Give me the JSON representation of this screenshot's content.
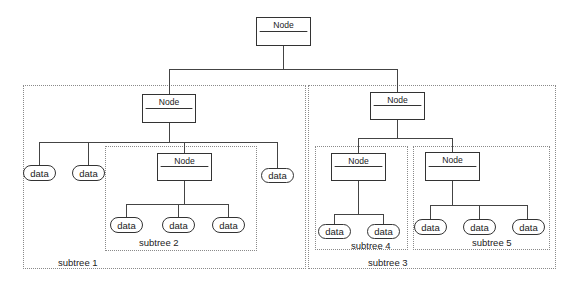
{
  "diagram": {
    "type": "tree",
    "root": {
      "label": "Node"
    },
    "subtrees": [
      {
        "label": "subtree 1",
        "node": "Node",
        "children": [
          "data",
          "data",
          "subtree 2",
          "data"
        ],
        "nested": {
          "label": "subtree 2",
          "node": "Node",
          "children": [
            "data",
            "data",
            "data"
          ]
        }
      },
      {
        "label": "subtree 3",
        "node": "Node",
        "nested": [
          {
            "label": "subtree 4",
            "node": "Node",
            "children": [
              "data",
              "data"
            ]
          },
          {
            "label": "subtree 5",
            "node": "Node",
            "children": [
              "data",
              "data",
              "data"
            ]
          }
        ]
      }
    ]
  },
  "labels": {
    "node": "Node",
    "data": "data",
    "subtree1": "subtree 1",
    "subtree2": "subtree 2",
    "subtree3": "subtree 3",
    "subtree4": "subtree 4",
    "subtree5": "subtree 5"
  },
  "colors": {
    "stroke": "#333333",
    "group_border": "#8a8a8a",
    "background": "#ffffff"
  }
}
